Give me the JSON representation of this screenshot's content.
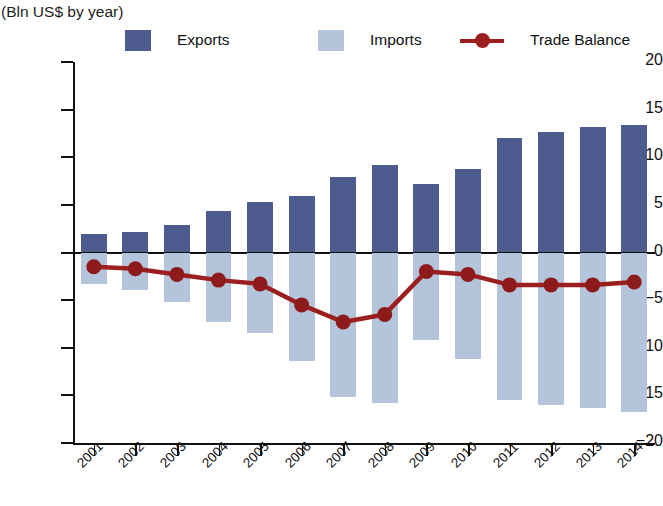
{
  "header": {
    "title": "",
    "subtitle": "(Bln US$ by year)"
  },
  "legend": {
    "items": [
      {
        "name": "exports",
        "label": "Exports",
        "color": "#4e5b8e",
        "marker": "square"
      },
      {
        "name": "imports",
        "label": "Imports",
        "color": "#b4c4da",
        "marker": "square"
      },
      {
        "name": "trade-balance",
        "label": "Trade Balance",
        "color": "#9c1f1f",
        "marker": "line-dot"
      }
    ]
  },
  "chart_data": {
    "type": "bar",
    "title": "",
    "subtitle": "(Bln US$ by year)",
    "xlabel": "",
    "ylabel": "",
    "ylim": [
      -20,
      20
    ],
    "yticks": [
      20,
      15,
      10,
      5,
      0,
      -5,
      -10,
      -15,
      -20
    ],
    "ytick_labels": [
      "20",
      "15",
      "10",
      "5",
      "0",
      "−5",
      "−10",
      "−15",
      "−20"
    ],
    "grid": false,
    "legend_position": "top",
    "categories": [
      "2001",
      "2002",
      "2003",
      "2004",
      "2005",
      "2006",
      "2007",
      "2008",
      "2009",
      "2010",
      "2011",
      "2012",
      "2013",
      "2014"
    ],
    "series": [
      {
        "name": "Exports",
        "type": "bar",
        "color": "#4e5b8e",
        "values": [
          1.9,
          2.2,
          2.9,
          4.4,
          5.3,
          5.9,
          7.9,
          9.2,
          7.2,
          8.8,
          12.0,
          12.6,
          13.2,
          13.4
        ]
      },
      {
        "name": "Imports",
        "type": "bar",
        "color": "#b4c4da",
        "values": [
          -3.3,
          -3.9,
          -5.2,
          -7.3,
          -8.5,
          -11.4,
          -15.2,
          -15.8,
          -9.2,
          -11.2,
          -15.5,
          -16.0,
          -16.3,
          -16.7
        ]
      },
      {
        "name": "Trade Balance",
        "type": "line",
        "color": "#9c1f1f",
        "values": [
          -1.5,
          -1.7,
          -2.3,
          -2.9,
          -3.3,
          -5.5,
          -7.3,
          -6.5,
          -2.0,
          -2.3,
          -3.4,
          -3.4,
          -3.4,
          -3.1
        ]
      }
    ]
  },
  "colors": {
    "exports": "#4e5b8e",
    "imports": "#b4c4da",
    "trade_balance": "#9c1f1f",
    "axis": "#111111",
    "background": "#ffffff"
  }
}
